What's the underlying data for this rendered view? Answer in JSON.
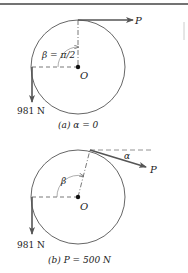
{
  "colors": {
    "ink": "#3a3a3a",
    "arrow": "#555555",
    "border": "#444444"
  },
  "diagrams": [
    {
      "id": "a",
      "force_label": "P",
      "weight_label": "981 N",
      "angle_label": "β = π/2",
      "center_label": "O",
      "caption": "(a) α = 0",
      "caption_prefix": "(a)",
      "caption_condition": "α = 0"
    },
    {
      "id": "b",
      "force_label": "P",
      "weight_label": "981 N",
      "angle_label": "β",
      "alpha_label": "α",
      "center_label": "O",
      "caption": "(b) P = 500 N",
      "caption_prefix": "(b)",
      "caption_condition": "P = 500 N"
    }
  ]
}
